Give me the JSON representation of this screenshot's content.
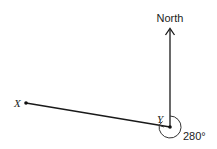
{
  "diagram": {
    "type": "bearing",
    "north_label": "North",
    "points": {
      "X": {
        "label": "X",
        "x": 26,
        "y": 103
      },
      "Y": {
        "label": "Y",
        "x": 170,
        "y": 127
      }
    },
    "angle_label": "280°",
    "colors": {
      "line": "#1a1a1a",
      "arc": "#333333",
      "text": "#222222"
    }
  }
}
